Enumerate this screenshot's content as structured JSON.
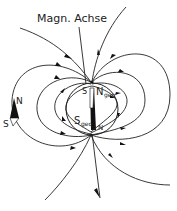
{
  "diagram": {
    "axis_label": "Magn. Achse",
    "earth": {
      "north_geo_label": "N",
      "north_geo_sub": "geo",
      "south_geo_label": "S",
      "south_geo_sub": "geo",
      "magnet_top_label": "S",
      "magnet_bottom_label": "N"
    },
    "compass": {
      "north_label": "N",
      "south_label": "S"
    },
    "colors": {
      "line": "#222222",
      "fill": "#111111",
      "background": "#ffffff"
    }
  }
}
